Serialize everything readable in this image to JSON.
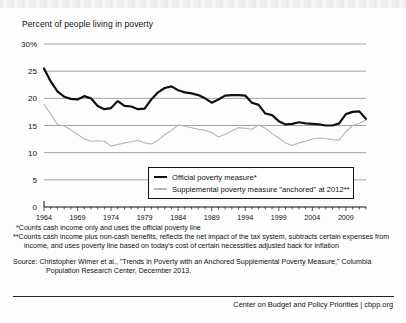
{
  "chart_title": "Percent of people living in poverty",
  "legend": {
    "items": [
      {
        "label": "— Official poverty measure*",
        "text": "Official poverty measure*",
        "color": "#111111",
        "name": "official"
      },
      {
        "label": "— Supplemental poverty measure \"anchored\" at 2012**",
        "text": "Supplemental poverty measure \"anchored\" at 2012**",
        "color": "#b6b6b6",
        "name": "supplemental"
      }
    ]
  },
  "notes": {
    "note1": "*Counts cash income only and uses the official poverty line",
    "note2": "**Counts cash income plus non-cash benefits, reflects the net impact of the tax system, subtracts certain expenses from income, and uses poverty line based on today's cost of certain necessities adjusted back for inflation",
    "source": "Source: Christopher Wimer et al., \"Trends in Poverty with an Anchored Supplemental Poverty Measure,\" Columbia Population Research Center, December 2013."
  },
  "footer": "Center on Budget and Policy Priorities | cbpp.org",
  "chart_data": {
    "type": "line",
    "title": "Percent of people living in poverty",
    "xlabel": "",
    "ylabel": "Percent of people living in poverty",
    "ylim": [
      0,
      30
    ],
    "yticks": [
      0,
      5,
      10,
      15,
      20,
      25,
      30
    ],
    "ytick_labels": [
      "0",
      "5",
      "10",
      "15",
      "20",
      "25",
      "30%"
    ],
    "xlim": [
      1964,
      2012
    ],
    "xticks": [
      1964,
      1969,
      1974,
      1979,
      1984,
      1989,
      1994,
      1999,
      2004,
      2009
    ],
    "xtick_labels": [
      "1964",
      "1969",
      "1974",
      "1979",
      "1984",
      "1989",
      "1994",
      "1999",
      "2004",
      "2009"
    ],
    "grid": "horizontal",
    "legend_position": "inside-bottom-center",
    "x": [
      1964,
      1965,
      1966,
      1967,
      1968,
      1969,
      1970,
      1971,
      1972,
      1973,
      1974,
      1975,
      1976,
      1977,
      1978,
      1979,
      1980,
      1981,
      1982,
      1983,
      1984,
      1985,
      1986,
      1987,
      1988,
      1989,
      1990,
      1991,
      1992,
      1993,
      1994,
      1995,
      1996,
      1997,
      1998,
      1999,
      2000,
      2001,
      2002,
      2003,
      2004,
      2005,
      2006,
      2007,
      2008,
      2009,
      2010,
      2011,
      2012
    ],
    "series": [
      {
        "name": "Official poverty measure*",
        "color": "#111111",
        "width": 2.2,
        "values": [
          25.5,
          23.1,
          21.3,
          20.3,
          19.9,
          19.8,
          20.4,
          20.0,
          18.6,
          18.0,
          18.2,
          19.5,
          18.6,
          18.5,
          18.0,
          18.1,
          19.8,
          21.1,
          21.9,
          22.2,
          21.5,
          21.1,
          20.9,
          20.6,
          20.0,
          19.2,
          19.8,
          20.5,
          20.6,
          20.6,
          20.5,
          19.2,
          18.8,
          17.2,
          16.9,
          15.8,
          15.2,
          15.3,
          15.6,
          15.4,
          15.3,
          15.2,
          15.0,
          15.0,
          15.4,
          17.1,
          17.5,
          17.6,
          16.2
        ]
      },
      {
        "name": "Supplemental poverty measure \"anchored\" at 2012**",
        "color": "#b6b6b6",
        "width": 1.1,
        "values": [
          18.9,
          17.1,
          15.2,
          14.9,
          14.2,
          13.4,
          12.5,
          12.1,
          12.2,
          12.1,
          11.2,
          11.5,
          11.8,
          12.0,
          12.3,
          11.8,
          11.6,
          12.3,
          13.3,
          14.1,
          15.1,
          14.9,
          14.6,
          14.3,
          14.1,
          13.7,
          12.9,
          13.4,
          14.0,
          14.6,
          14.5,
          14.3,
          15.1,
          14.5,
          13.5,
          12.7,
          11.8,
          11.3,
          11.8,
          12.1,
          12.5,
          12.7,
          12.6,
          12.4,
          12.3,
          13.9,
          15.0,
          15.4,
          16.0
        ]
      }
    ]
  }
}
